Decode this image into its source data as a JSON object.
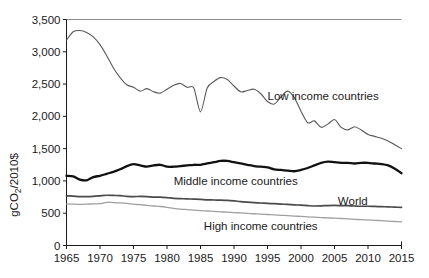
{
  "chart_data": {
    "type": "line",
    "title": "",
    "subtitle": "",
    "xlabel": "",
    "ylabel": "gCO2/2010$",
    "ylabel_display": "gCO₂/2010$",
    "xlim": [
      1965,
      2015
    ],
    "ylim": [
      0,
      3500
    ],
    "grid": false,
    "legend_position": "inline-annotations",
    "x_ticks": [
      1965,
      1970,
      1975,
      1980,
      1985,
      1990,
      1995,
      2000,
      2005,
      2010,
      2015
    ],
    "x_tick_labels": [
      "1965",
      "1970",
      "1975",
      "1980",
      "1985",
      "1990",
      "1995",
      "2000",
      "2005",
      "2010",
      "2015"
    ],
    "y_ticks": [
      0,
      500,
      1000,
      1500,
      2000,
      2500,
      3000,
      3500
    ],
    "y_tick_labels": [
      "0",
      "500",
      "1,000",
      "1,500",
      "2,000",
      "2,500",
      "3,000",
      "3,500"
    ],
    "x": [
      1965,
      1966,
      1967,
      1968,
      1969,
      1970,
      1971,
      1972,
      1973,
      1974,
      1975,
      1976,
      1977,
      1978,
      1979,
      1980,
      1981,
      1982,
      1983,
      1984,
      1985,
      1986,
      1987,
      1988,
      1989,
      1990,
      1991,
      1992,
      1993,
      1994,
      1995,
      1996,
      1997,
      1998,
      1999,
      2000,
      2001,
      2002,
      2003,
      2004,
      2005,
      2006,
      2007,
      2008,
      2009,
      2010,
      2011,
      2012,
      2013,
      2014,
      2015
    ],
    "series": [
      {
        "name": "Low income countries",
        "color": "#595959",
        "width": 1.1,
        "label_x": 1995.0,
        "label_y": 2320,
        "values": [
          3180,
          3310,
          3330,
          3300,
          3230,
          3110,
          2940,
          2750,
          2600,
          2490,
          2450,
          2390,
          2430,
          2380,
          2360,
          2420,
          2480,
          2510,
          2450,
          2440,
          2070,
          2440,
          2540,
          2600,
          2570,
          2470,
          2380,
          2400,
          2420,
          2350,
          2230,
          2190,
          2300,
          2390,
          2290,
          2080,
          1900,
          1930,
          1830,
          1880,
          1950,
          1830,
          1790,
          1840,
          1790,
          1720,
          1690,
          1660,
          1620,
          1560,
          1500
        ]
      },
      {
        "name": "Middle income countries",
        "color": "#111111",
        "width": 2.3,
        "label_x": 1981.0,
        "label_y": 1000,
        "values": [
          1080,
          1070,
          1020,
          1010,
          1060,
          1080,
          1110,
          1140,
          1180,
          1230,
          1260,
          1240,
          1220,
          1240,
          1250,
          1220,
          1220,
          1230,
          1240,
          1250,
          1250,
          1270,
          1290,
          1310,
          1310,
          1290,
          1270,
          1250,
          1230,
          1220,
          1210,
          1180,
          1170,
          1160,
          1150,
          1170,
          1200,
          1240,
          1280,
          1300,
          1290,
          1280,
          1280,
          1270,
          1280,
          1280,
          1270,
          1260,
          1240,
          1190,
          1120
        ]
      },
      {
        "name": "World",
        "color": "#4a4a4a",
        "width": 1.7,
        "label_x": 2005.5,
        "label_y": 690,
        "values": [
          770,
          765,
          758,
          757,
          762,
          770,
          778,
          775,
          772,
          762,
          758,
          760,
          756,
          748,
          750,
          742,
          730,
          726,
          722,
          718,
          714,
          708,
          705,
          702,
          698,
          690,
          680,
          672,
          665,
          658,
          652,
          648,
          642,
          636,
          630,
          624,
          618,
          612,
          614,
          618,
          620,
          618,
          616,
          612,
          608,
          608,
          605,
          602,
          598,
          594,
          590
        ]
      },
      {
        "name": "High income countries",
        "color": "#a0a0a0",
        "width": 1.3,
        "label_x": 1985.5,
        "label_y": 300,
        "values": [
          645,
          640,
          638,
          640,
          645,
          648,
          668,
          665,
          660,
          652,
          640,
          632,
          622,
          612,
          604,
          592,
          576,
          564,
          556,
          548,
          540,
          534,
          528,
          522,
          516,
          510,
          504,
          498,
          492,
          486,
          480,
          474,
          468,
          462,
          456,
          450,
          444,
          438,
          432,
          428,
          424,
          418,
          412,
          406,
          400,
          396,
          390,
          384,
          378,
          372,
          365
        ]
      }
    ]
  },
  "axis": {
    "y_axis_title": "gCO₂/2010$"
  }
}
